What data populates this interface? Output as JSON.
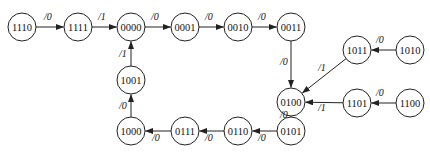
{
  "diagram": {
    "type": "state-transition",
    "node_radius": 14,
    "nodes": [
      {
        "id": "1110",
        "label": "1110",
        "x": 22,
        "y": 27
      },
      {
        "id": "1111",
        "label": "1111",
        "x": 78,
        "y": 27
      },
      {
        "id": "0000",
        "label": "0000",
        "x": 131,
        "y": 27
      },
      {
        "id": "0001",
        "label": "0001",
        "x": 185,
        "y": 27
      },
      {
        "id": "0010",
        "label": "0010",
        "x": 238,
        "y": 27
      },
      {
        "id": "0011",
        "label": "0011",
        "x": 291,
        "y": 27
      },
      {
        "id": "0100",
        "label": "0100",
        "x": 291,
        "y": 102
      },
      {
        "id": "1011",
        "label": "1011",
        "x": 357,
        "y": 50
      },
      {
        "id": "1010",
        "label": "1010",
        "x": 410,
        "y": 50
      },
      {
        "id": "1101",
        "label": "1101",
        "x": 357,
        "y": 103
      },
      {
        "id": "1100",
        "label": "1100",
        "x": 410,
        "y": 103
      },
      {
        "id": "0101",
        "label": "0101",
        "x": 291,
        "y": 131
      },
      {
        "id": "0110",
        "label": "0110",
        "x": 238,
        "y": 131
      },
      {
        "id": "0111",
        "label": "0111",
        "x": 185,
        "y": 131
      },
      {
        "id": "1000",
        "label": "1000",
        "x": 131,
        "y": 131
      },
      {
        "id": "1001",
        "label": "1001",
        "x": 131,
        "y": 80
      }
    ],
    "edges": [
      {
        "from": "1110",
        "to": "1111",
        "label": "/0",
        "lx": 44,
        "ly": 20
      },
      {
        "from": "1111",
        "to": "0000",
        "label": "/1",
        "lx": 98,
        "ly": 20
      },
      {
        "from": "0000",
        "to": "0001",
        "label": "/0",
        "lx": 151,
        "ly": 20
      },
      {
        "from": "0001",
        "to": "0010",
        "label": "/0",
        "lx": 205,
        "ly": 20
      },
      {
        "from": "0010",
        "to": "0011",
        "label": "/0",
        "lx": 258,
        "ly": 20
      },
      {
        "from": "0011",
        "to": "0100",
        "label": "/0",
        "lx": 280,
        "ly": 65
      },
      {
        "from": "1011",
        "to": "0100",
        "label": "/1",
        "lx": 318,
        "ly": 71
      },
      {
        "from": "1010",
        "to": "1011",
        "label": "/0",
        "lx": 376,
        "ly": 43
      },
      {
        "from": "1101",
        "to": "0100",
        "label": "/1",
        "lx": 318,
        "ly": 111
      },
      {
        "from": "1100",
        "to": "1101",
        "label": "/0",
        "lx": 376,
        "ly": 96
      },
      {
        "from": "0100",
        "to": "0101",
        "label": "/0",
        "lx": 280,
        "ly": 118
      },
      {
        "from": "0101",
        "to": "0110",
        "label": "/0",
        "lx": 258,
        "ly": 141
      },
      {
        "from": "0110",
        "to": "0111",
        "label": "/0",
        "lx": 205,
        "ly": 141
      },
      {
        "from": "0111",
        "to": "1000",
        "label": "/0",
        "lx": 152,
        "ly": 141
      },
      {
        "from": "1000",
        "to": "1001",
        "label": "/0",
        "lx": 119,
        "ly": 109
      },
      {
        "from": "1001",
        "to": "0000",
        "label": "/1",
        "lx": 119,
        "ly": 57
      }
    ]
  }
}
